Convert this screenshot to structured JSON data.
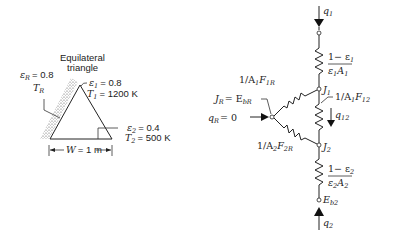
{
  "left_figure": {
    "caption_line1": "Equilateral",
    "caption_line2": "triangle",
    "surface_R": {
      "emissivity_label": "ε",
      "emissivity_sub": "R",
      "emissivity_value": "= 0.8",
      "temp_label": "T",
      "temp_sub": "R"
    },
    "surface_1": {
      "emissivity_label": "ε",
      "emissivity_sub": "1",
      "emissivity_value": "= 0.8",
      "temp_label": "T",
      "temp_sub": "1",
      "temp_value": "= 1200 K"
    },
    "surface_2": {
      "emissivity_label": "ε",
      "emissivity_sub": "2",
      "emissivity_value": "= 0.4",
      "temp_label": "T",
      "temp_sub": "2",
      "temp_value": "= 500 K"
    },
    "width_label": "W",
    "width_value": "= 1 m"
  },
  "network": {
    "q1": {
      "label": "q",
      "sub": "1"
    },
    "R1": {
      "num": "1− ε",
      "num_sub": "1",
      "den_a": "ε",
      "den_a_sub": "1",
      "den_b": "A",
      "den_b_sub": "1"
    },
    "J1": {
      "label": "J",
      "sub": "1"
    },
    "R1R": {
      "prefix": "1/A",
      "a_sub": "1",
      "f": "F",
      "f_sub": "1R"
    },
    "R12": {
      "prefix": "1/A",
      "a_sub": "1",
      "f": "F",
      "f_sub": "12"
    },
    "q12": {
      "label": "q",
      "sub": "12"
    },
    "JR": {
      "label": "J",
      "sub": "R",
      "eq": "= E",
      "eq_sub": "bR"
    },
    "qR": {
      "label": "q",
      "sub": "R",
      "value": "= 0"
    },
    "R2R": {
      "prefix": "1/A",
      "a_sub": "2",
      "f": "F",
      "f_sub": "2R"
    },
    "J2": {
      "label": "J",
      "sub": "2"
    },
    "R2": {
      "num": "1− ε",
      "num_sub": "2",
      "den_a": "ε",
      "den_a_sub": "2",
      "den_b": "A",
      "den_b_sub": "2"
    },
    "Eb2": {
      "label": "E",
      "sub": "b2"
    },
    "q2": {
      "label": "q",
      "sub": "2"
    }
  }
}
